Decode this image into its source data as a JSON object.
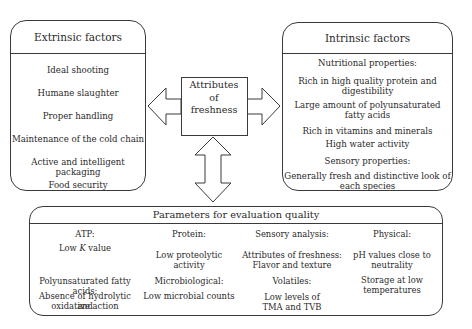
{
  "extrinsic": {
    "title": "Extrinsic factors",
    "items": [
      "Ideal shooting",
      "Humane slaughter",
      "Proper handling",
      "Maintenance of the cold chain",
      "Active and intelligent packaging",
      "Food security"
    ]
  },
  "center": {
    "line1": "Attributes",
    "line2": "of",
    "line3": "freshness"
  },
  "intrinsic": {
    "title": "Intrinsic factors",
    "nutritional_heading": "Nutritional properties:",
    "nutritional_items": [
      [
        "Rich in high quality protein and",
        "digestibility"
      ],
      [
        "Large amount of polyunsaturated",
        "fatty acids"
      ],
      [
        "Rich in vitamins and minerals"
      ],
      [
        "High water activity"
      ]
    ],
    "sensory_heading": "Sensory properties:",
    "sensory_items": [
      [
        "Generally fresh and distinctive look of",
        "each species"
      ]
    ]
  },
  "params": {
    "title": "Parameters for evaluation quality",
    "atp": {
      "heading": "ATP:",
      "value_pre": "Low ",
      "value_italic": "K",
      "value_post": " value"
    },
    "protein": {
      "heading": "Protein:",
      "value": [
        "Low proteolytic",
        "activity"
      ]
    },
    "sensory": {
      "heading": "Sensory analysis:",
      "value": [
        "Attributes of freshness:",
        "Flavor and texture"
      ]
    },
    "physical": {
      "heading": "Physical:",
      "value": [
        "pH values close to",
        "neutrality"
      ]
    },
    "pufa": {
      "heading": "Polyunsaturated fatty acids:",
      "value": [
        "Absence of hydrolytic and",
        "oxidative action"
      ]
    },
    "micro": {
      "heading": "Microbiological:",
      "value": [
        "Low microbial counts"
      ]
    },
    "volatiles": {
      "heading": "Volatiles:",
      "value": [
        "Low levels of",
        "TMA and TVB"
      ]
    },
    "storage": {
      "value": [
        "Storage at low",
        "temperatures"
      ]
    }
  },
  "colors": {
    "stroke": "#3a3a3a",
    "text": "#2a2a2a",
    "background": "#ffffff"
  }
}
